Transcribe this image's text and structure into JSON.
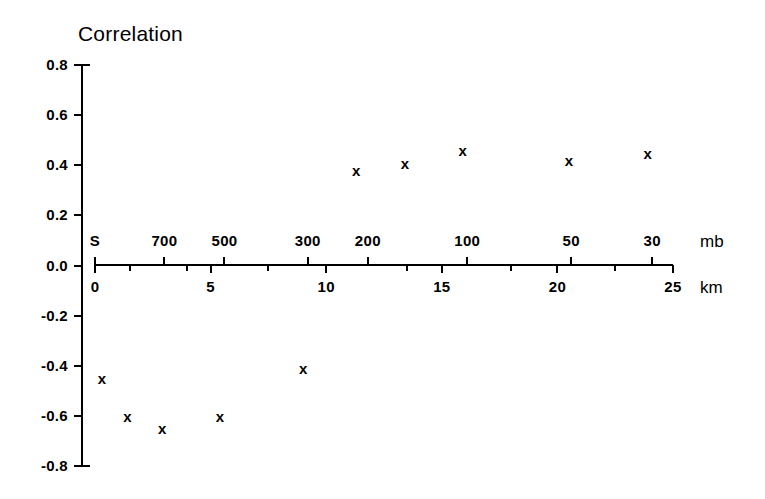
{
  "chart_data": {
    "type": "scatter",
    "title": "Correlation",
    "xlabel": "km",
    "ylabel": "",
    "ylim": [
      -0.8,
      0.8
    ],
    "xlim": [
      0,
      25
    ],
    "grid": false,
    "legend": null,
    "y_ticks": [
      "0.8",
      "0.6",
      "0.4",
      "0.2",
      "0.0",
      "-0.2",
      "-0.4",
      "-0.6",
      "-0.8"
    ],
    "y_tick_values": [
      0.8,
      0.6,
      0.4,
      0.2,
      0.0,
      -0.2,
      -0.4,
      -0.6,
      -0.8
    ],
    "secondary_xaxis": {
      "label": "mb",
      "position": "top",
      "tick_labels": [
        "S",
        "700",
        "500",
        "300",
        "200",
        "100",
        "50",
        "30"
      ],
      "tick_km": [
        0.0,
        3.0,
        5.6,
        9.2,
        11.8,
        16.1,
        20.6,
        24.1
      ]
    },
    "primary_xaxis": {
      "label": "km",
      "position": "bottom",
      "tick_labels": [
        "0",
        "5",
        "10",
        "15",
        "20",
        "25"
      ],
      "tick_values": [
        0,
        5,
        10,
        15,
        20,
        25
      ],
      "minor_ticks": [
        1.5,
        4.0,
        7.5,
        13.5,
        18.0,
        22.5
      ]
    },
    "marker": "x",
    "x": [
      0.3,
      1.4,
      2.9,
      5.4,
      9.0,
      11.3,
      13.4,
      15.9,
      20.5,
      23.9
    ],
    "y": [
      -0.45,
      -0.6,
      -0.65,
      -0.6,
      -0.41,
      0.38,
      0.41,
      0.46,
      0.42,
      0.45
    ],
    "points": [
      {
        "km": 0.3,
        "correlation": -0.45,
        "mb": "S"
      },
      {
        "km": 1.4,
        "correlation": -0.6,
        "mb": "850"
      },
      {
        "km": 2.9,
        "correlation": -0.65,
        "mb": "700"
      },
      {
        "km": 5.4,
        "correlation": -0.6,
        "mb": "500"
      },
      {
        "km": 9.0,
        "correlation": -0.41,
        "mb": "300"
      },
      {
        "km": 11.3,
        "correlation": 0.38,
        "mb": "200"
      },
      {
        "km": 13.4,
        "correlation": 0.41,
        "mb": "150"
      },
      {
        "km": 15.9,
        "correlation": 0.46,
        "mb": "100"
      },
      {
        "km": 20.5,
        "correlation": 0.42,
        "mb": "50"
      },
      {
        "km": 23.9,
        "correlation": 0.45,
        "mb": "30"
      }
    ]
  },
  "colors": {
    "axis": "#000000",
    "marker": "#000000",
    "background": "#ffffff"
  }
}
